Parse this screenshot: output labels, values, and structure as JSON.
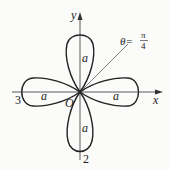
{
  "figure": {
    "type": "polar rose curve (four petals)",
    "axes": {
      "x_label": "x",
      "y_label": "y",
      "origin_label": "O"
    },
    "ray": {
      "label_prefix": "θ=",
      "numerator": "π",
      "denominator": "4"
    },
    "petal_labels": [
      "a",
      "a",
      "a",
      "a"
    ],
    "tip_labels": {
      "left": "3",
      "bottom": "2"
    },
    "colors": {
      "curve": "#222222",
      "axis": "#333333",
      "ray": "#555555",
      "background": "#fbfbfa"
    }
  }
}
